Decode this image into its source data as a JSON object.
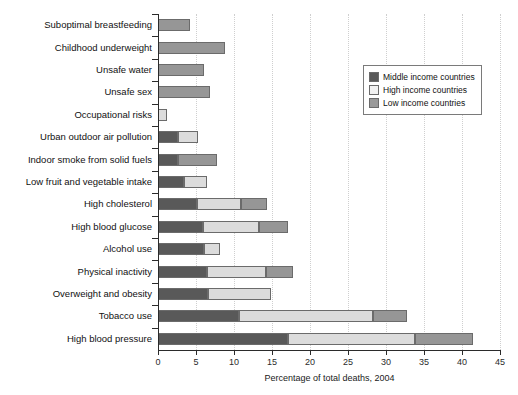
{
  "chart_data": {
    "type": "bar",
    "orientation": "horizontal",
    "stacked": true,
    "title": "",
    "xlabel": "Percentage of total deaths, 2004",
    "ylabel": "",
    "xlim": [
      0,
      45
    ],
    "xticks": [
      0,
      5,
      10,
      15,
      20,
      25,
      30,
      35,
      40,
      45
    ],
    "grid": "vertical-dotted",
    "legend_position": "upper-right",
    "categories": [
      "Suboptimal breastfeeding",
      "Childhood underweight",
      "Unsafe water",
      "Unsafe sex",
      "Occupational risks",
      "Urban outdoor air pollution",
      "Indoor smoke from solid fuels",
      "Low fruit and vegetable intake",
      "High cholesterol",
      "High blood glucose",
      "Alcohol use",
      "Physical inactivity",
      "Overweight and obesity",
      "Tobacco use",
      "High blood pressure"
    ],
    "series": [
      {
        "name": "Middle income countries",
        "color": "#595959",
        "values": [
          0.0,
          0.0,
          0.0,
          0.0,
          0.0,
          2.6,
          2.6,
          3.4,
          5.1,
          5.9,
          6.1,
          6.5,
          6.6,
          10.7,
          17.1
        ]
      },
      {
        "name": "High income countries",
        "color": "#dcdcdc",
        "values": [
          0.0,
          0.0,
          0.0,
          0.0,
          1.2,
          2.7,
          0.0,
          3.1,
          5.8,
          7.4,
          2.1,
          7.7,
          8.3,
          17.6,
          16.7
        ]
      },
      {
        "name": "Low income countries",
        "color": "#969696",
        "values": [
          4.2,
          8.8,
          6.1,
          6.8,
          0.0,
          0.0,
          5.2,
          0.0,
          3.5,
          3.8,
          0.0,
          3.6,
          0.0,
          4.5,
          7.6
        ]
      }
    ],
    "stack_totals": [
      4.2,
      8.8,
      6.1,
      6.8,
      1.2,
      5.3,
      7.8,
      6.5,
      14.4,
      17.1,
      8.2,
      17.8,
      14.9,
      32.8,
      41.4
    ]
  },
  "legend": {
    "items": [
      {
        "label": "Middle income countries",
        "color": "#595959"
      },
      {
        "label": "High income countries",
        "color": "#f2f2f2"
      },
      {
        "label": "Low income countries",
        "color": "#9a9a9a"
      }
    ]
  },
  "axis": {
    "x_title": "Percentage of total deaths, 2004",
    "tick_labels": [
      "0",
      "5",
      "10",
      "15",
      "20",
      "25",
      "30",
      "35",
      "40",
      "45"
    ]
  }
}
